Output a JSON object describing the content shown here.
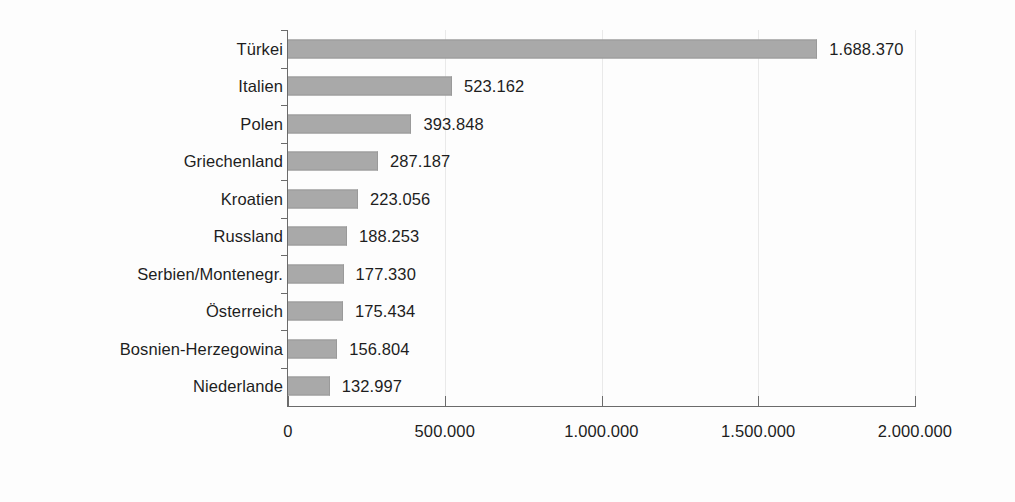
{
  "chart_data": {
    "type": "bar",
    "orientation": "horizontal",
    "title": "",
    "subtitle": "",
    "xlabel": "",
    "ylabel": "",
    "categories": [
      "Türkei",
      "Italien",
      "Polen",
      "Griechenland",
      "Kroatien",
      "Russland",
      "Serbien/Montenegr.",
      "Österreich",
      "Bosnien-Herzegowina",
      "Niederlande"
    ],
    "values": [
      1688370,
      523162,
      393848,
      287187,
      223056,
      188253,
      177330,
      175434,
      156804,
      132997
    ],
    "value_labels": [
      "1.688.370",
      "523.162",
      "393.848",
      "287.187",
      "223.056",
      "188.253",
      "177.330",
      "175.434",
      "156.804",
      "132.997"
    ],
    "xlim": [
      0,
      2000000
    ],
    "xticks": [
      0,
      500000,
      1000000,
      1500000,
      2000000
    ],
    "xtick_labels": [
      "0",
      "500.000",
      "1.000.000",
      "1.500.000",
      "2.000.000"
    ],
    "grid": true,
    "grid_axis": "x",
    "legend": null,
    "bar_color": "#a9a9a9",
    "bar_edge_color": "#9a9a9a",
    "axis_color": "#6b6b6b",
    "text_color": "#1e1e1e",
    "background_color": "#fdfdfd"
  }
}
